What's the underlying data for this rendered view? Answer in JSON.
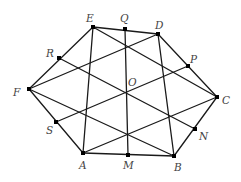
{
  "diagram": {
    "type": "geometry",
    "points": [
      {
        "id": "A",
        "x": 83,
        "y": 153,
        "marker": true,
        "lx": 79,
        "ly": 169
      },
      {
        "id": "B",
        "x": 174,
        "y": 156,
        "marker": true,
        "lx": 174,
        "ly": 171
      },
      {
        "id": "C",
        "x": 217,
        "y": 97,
        "marker": true,
        "lx": 222,
        "ly": 104
      },
      {
        "id": "D",
        "x": 158,
        "y": 34,
        "marker": true,
        "lx": 155,
        "ly": 29
      },
      {
        "id": "E",
        "x": 93,
        "y": 27,
        "marker": true,
        "lx": 86,
        "ly": 22
      },
      {
        "id": "F",
        "x": 29,
        "y": 89,
        "marker": true,
        "lx": 13,
        "ly": 96
      },
      {
        "id": "M",
        "x": 128,
        "y": 155,
        "marker": true,
        "lx": 123,
        "ly": 169
      },
      {
        "id": "N",
        "x": 195,
        "y": 129,
        "marker": true,
        "lx": 199,
        "ly": 140
      },
      {
        "id": "P",
        "x": 188,
        "y": 66,
        "marker": true,
        "lx": 190,
        "ly": 63
      },
      {
        "id": "Q",
        "x": 125,
        "y": 29,
        "marker": true,
        "lx": 120,
        "ly": 22
      },
      {
        "id": "R",
        "x": 59,
        "y": 58,
        "marker": true,
        "lx": 46,
        "ly": 57
      },
      {
        "id": "S",
        "x": 56,
        "y": 122,
        "marker": true,
        "lx": 46,
        "ly": 134
      },
      {
        "id": "O",
        "x": 125,
        "y": 93,
        "marker": false,
        "lx": 128,
        "ly": 86
      }
    ],
    "segments": [
      [
        "A",
        "B"
      ],
      [
        "B",
        "C"
      ],
      [
        "C",
        "D"
      ],
      [
        "D",
        "E"
      ],
      [
        "E",
        "F"
      ],
      [
        "F",
        "A"
      ],
      [
        "E",
        "A"
      ],
      [
        "D",
        "B"
      ],
      [
        "Q",
        "M"
      ],
      [
        "F",
        "D"
      ],
      [
        "A",
        "C"
      ],
      [
        "S",
        "P"
      ],
      [
        "E",
        "C"
      ],
      [
        "F",
        "B"
      ],
      [
        "R",
        "N"
      ]
    ],
    "colors": {
      "line": "#1a1a1a",
      "label": "#444444",
      "point": "#000000",
      "background": "#ffffff"
    }
  }
}
